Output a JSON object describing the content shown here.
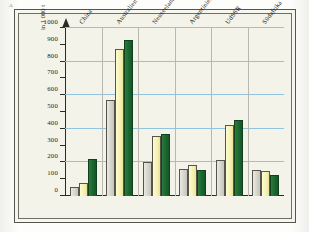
{
  "figure": {
    "marker": "A",
    "axis_title": "in 1 000 t"
  },
  "chart_data": {
    "type": "bar",
    "title": "",
    "subtitle": "",
    "xlabel": "",
    "ylabel": "in 1 000 t",
    "ylim": [
      0,
      1000
    ],
    "yticks": [
      0,
      100,
      200,
      300,
      400,
      500,
      600,
      700,
      800,
      900,
      1000
    ],
    "ytick_labels": [
      "0",
      "100",
      "200",
      "300",
      "400",
      "500",
      "600",
      "700",
      "800",
      "900",
      "1000"
    ],
    "gridlines": [
      200,
      400,
      600,
      800,
      1000
    ],
    "grid": true,
    "legend": "none",
    "categories": [
      "China",
      "Australien",
      "Neuseeland",
      "Argentinien",
      "UdSSR",
      "Südafrika"
    ],
    "series": [
      {
        "name": "series-1",
        "color": "#d6d5cc",
        "values": [
          55,
          570,
          200,
          160,
          215,
          155
        ]
      },
      {
        "name": "series-2",
        "color": "#f6f2b5",
        "values": [
          75,
          875,
          355,
          185,
          420,
          150
        ]
      },
      {
        "name": "series-3",
        "color": "#1d6b30",
        "values": [
          220,
          930,
          370,
          155,
          450,
          125
        ]
      }
    ]
  }
}
